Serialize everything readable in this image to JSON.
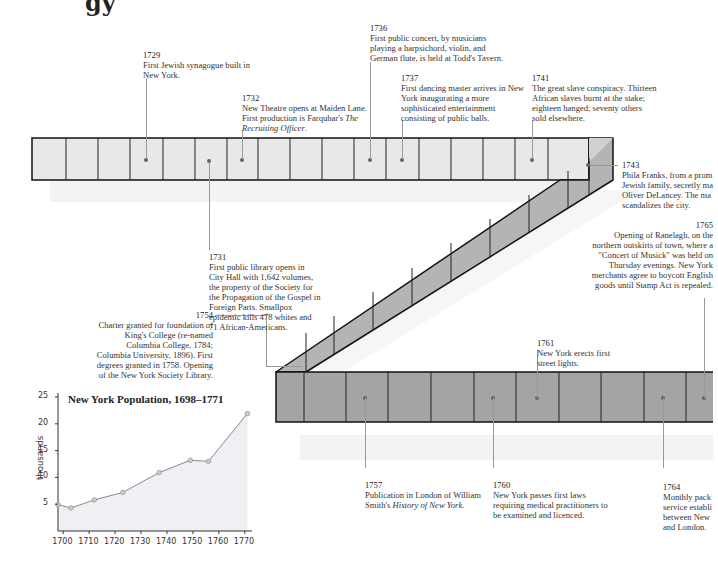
{
  "heading_fragment": "gy",
  "timeline": {
    "colors": {
      "top_band": "#e8e8e8",
      "diagonal_band": "#b4b4b4",
      "bottom_band": "#a4a4a4",
      "outline": "#111111",
      "shadow": "#f2f2f2"
    },
    "events": [
      {
        "year": "1729",
        "text": "First Jewish synagogue built in New York."
      },
      {
        "year": "1731",
        "text": "First public library opens in City Hall with 1,642 volumes, the property of the Society for the Propagation of the Gospel in Foreign Parts. Smallpox epidemic kills 478 whites and 71 African-Americans."
      },
      {
        "year": "1732",
        "text_pre": "New Theatre opens at Maiden Lane. First production is Farquhar's ",
        "text_italic": "The Recruiting Officer",
        "text_post": "."
      },
      {
        "year": "1736",
        "text": "First public concert, by musicians playing a harpsichord, violin, and German flute, is held at Todd's Tavern."
      },
      {
        "year": "1737",
        "text": "First dancing master arrives in New York inaugurating a more sophisticated entertainment consisting of public balls."
      },
      {
        "year": "1741",
        "text": "The great slave conspiracy. Thirteen African slaves burnt at the stake; eighteen hanged; seventy others sold elsewhere."
      },
      {
        "year": "1743",
        "text": "Phila Franks, from a prom Jewish family, secretly ma Oliver DeLancey. The ma scandalizes the city."
      },
      {
        "year": "1754",
        "text": "Charter granted for foundation of King's College (re-named Columbia College, 1784; Columbia University, 1896). First degrees granted in 1758. Opening of the New York Society Library."
      },
      {
        "year": "1757",
        "text_pre": "Publication in London of William Smith's ",
        "text_italic": "History of New York",
        "text_post": "."
      },
      {
        "year": "1760",
        "text": "New York passes first laws requiring medical practitioners to be examined and licenced."
      },
      {
        "year": "1761",
        "text": "New York erects first street lights."
      },
      {
        "year": "1764",
        "text": "Monthly pack service establi between New and London."
      },
      {
        "year": "1765",
        "text": "Opening of Ranelagh, on the northern outskirts of town, where a \"Concert of Musick\" was held on Thursday evenings. New York merchants agree to boycott English goods until Stamp Act is repealed."
      }
    ]
  },
  "chart_data": {
    "type": "line",
    "title": "New York Population, 1698–1771",
    "xlabel": "",
    "ylabel": "thousands",
    "x": [
      1698,
      1703,
      1712,
      1723,
      1737,
      1749,
      1756,
      1771
    ],
    "values": [
      4.9,
      4.3,
      5.8,
      7.2,
      10.9,
      13.2,
      13.0,
      21.9
    ],
    "x_ticks": [
      "1700",
      "1710",
      "1720",
      "1730",
      "1740",
      "1750",
      "1760",
      "1770"
    ],
    "y_ticks": [
      "5",
      "10",
      "15",
      "20",
      "25"
    ],
    "ylim": [
      0,
      25
    ],
    "xlim": [
      1698,
      1772
    ],
    "grid": false,
    "area_fill": "#f0f0f4",
    "line_color": "#888888",
    "marker_color": "#cccccc"
  }
}
